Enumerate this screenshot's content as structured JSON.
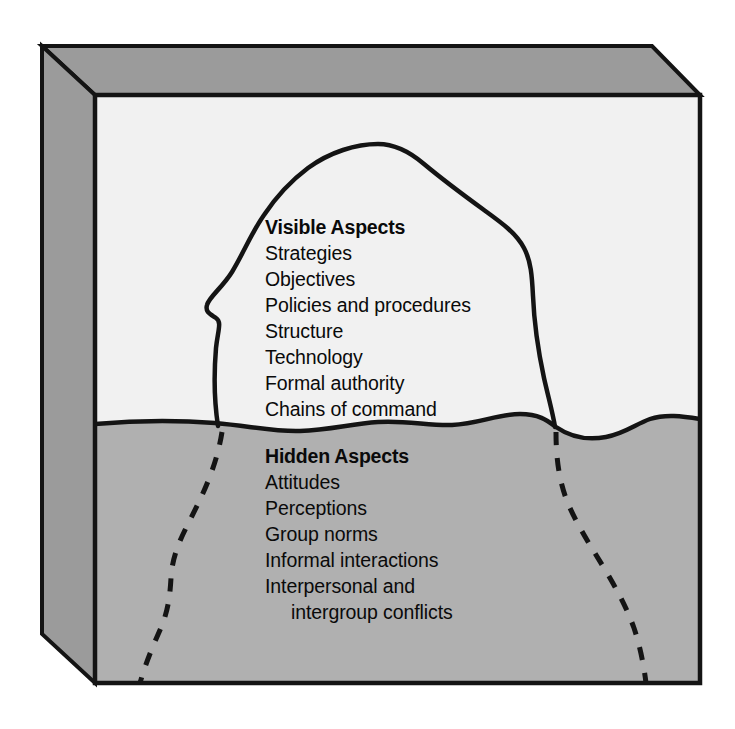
{
  "diagram": {
    "type": "iceberg-model",
    "title": "",
    "colors": {
      "sky": "#f1f1f1",
      "water": "#b0b0b0",
      "box_top_face": "#9b9b9b",
      "box_left_face": "#9b9b9b",
      "outline": "#141414",
      "text": "#0a0a0a",
      "page_background": "#ffffff"
    },
    "waterline_label": "",
    "above_water": {
      "heading": "Visible Aspects",
      "items": [
        "Strategies",
        "Objectives",
        "Policies and procedures",
        "Structure",
        "Technology",
        "Formal authority",
        "Chains of command"
      ]
    },
    "below_water": {
      "heading": "Hidden Aspects",
      "items": [
        "Attitudes",
        "Perceptions",
        "Group norms",
        "Informal interactions",
        "Interpersonal and",
        "intergroup conflicts"
      ],
      "indented_items": [
        5
      ]
    }
  }
}
